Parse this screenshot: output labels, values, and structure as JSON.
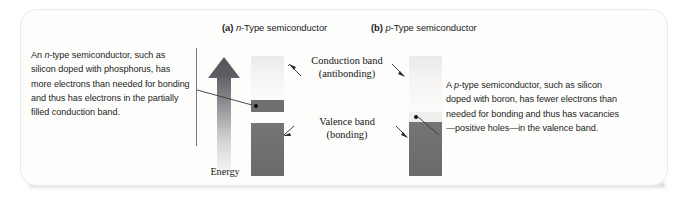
{
  "figure": {
    "titles": [
      {
        "tag": "(a)",
        "italic": "n",
        "rest": "-Type semiconductor"
      },
      {
        "tag": "(b)",
        "italic": "p",
        "rest": "-Type semiconductor"
      }
    ],
    "caption_left": {
      "lead": "An ",
      "italic": "n",
      "text": "-type semiconductor, such as silicon doped with phosphorus, has more electrons than needed for bonding and thus has electrons in the partially filled conduction band."
    },
    "caption_right": {
      "lead": "A ",
      "italic": "p",
      "text": "-type semiconductor, such as silicon doped with boron, has fewer electrons than needed for bonding and thus has vacancies—positive holes—in the valence band."
    },
    "axis_label": "Energy",
    "band_labels": {
      "conduction_line1": "Conduction band",
      "conduction_line2": "(antibonding)",
      "valence_line1": "Valence band",
      "valence_line2": "(bonding)"
    },
    "colors": {
      "band_dark": "#6e6e6e",
      "band_light": "#f4f3f1",
      "carrier_dot": "#0b0b0b",
      "arrow_top": "#59595a",
      "arrow_bottom": "#f2f1ef",
      "rule": "#7b7b7b",
      "card_background": "#fdfdfc",
      "page_background": "#ffffff"
    },
    "diagrams": {
      "n_type": {
        "conduction_band_state": "partially filled",
        "carrier": "electron",
        "carrier_symbol": "•",
        "valence_band_state": "filled"
      },
      "p_type": {
        "conduction_band_state": "empty",
        "carrier": "hole",
        "carrier_symbol": "•",
        "valence_band_state": "partially vacant"
      }
    }
  }
}
